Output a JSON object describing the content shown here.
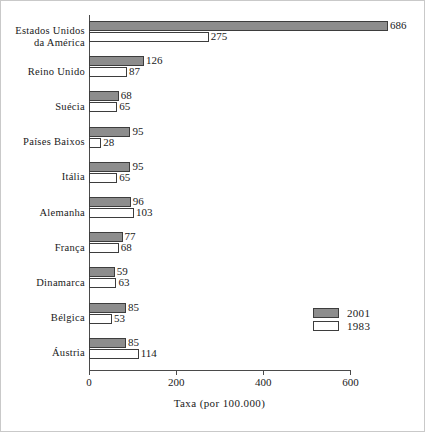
{
  "chart_data": {
    "type": "bar",
    "orientation": "horizontal",
    "title": "",
    "xlabel": "Taxa (por 100.000)",
    "ylabel": "",
    "xlim": [
      0,
      700
    ],
    "xticks": [
      0,
      200,
      400,
      600
    ],
    "xticklabels": [
      "0",
      "200",
      "400",
      "600"
    ],
    "grid": false,
    "legend_position": "bottom-right",
    "categories": [
      "Estados  Unidos\nda  América",
      "Reino  Unido",
      "Suécia",
      "Países  Baixos",
      "Itália",
      "Alemanha",
      "França",
      "Dinamarca",
      "Bélgica",
      "Áustria"
    ],
    "series": [
      {
        "name": "2001",
        "color": "#8d8d8d",
        "values": [
          686,
          126,
          68,
          95,
          95,
          96,
          77,
          59,
          85,
          85
        ]
      },
      {
        "name": "1983",
        "color": "#ffffff",
        "values": [
          275,
          87,
          65,
          28,
          65,
          103,
          68,
          63,
          53,
          114
        ]
      }
    ]
  },
  "legend": {
    "entries": [
      {
        "label": "2001",
        "swatch": "filled-gray"
      },
      {
        "label": "1983",
        "swatch": "empty-white"
      }
    ]
  },
  "axis": {
    "x_title": "Taxa (por 100.000)"
  }
}
